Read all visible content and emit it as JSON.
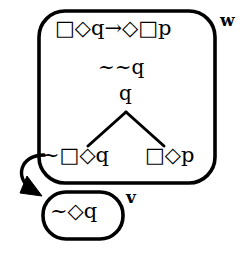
{
  "diagram": {
    "type": "modal-logic-tableau",
    "stroke_color": "#000000",
    "background_color": "#ffffff",
    "worlds": [
      {
        "id": "w",
        "label": "w",
        "shape": "rounded-rectangle",
        "formulas": [
          {
            "id": "premise",
            "text": "□◇q→◇□p",
            "role": "root-implication"
          },
          {
            "id": "double-negation",
            "text": "~~q",
            "role": "assumption"
          },
          {
            "id": "q",
            "text": "q",
            "role": "branch-node"
          },
          {
            "id": "branch-left",
            "text": "~□◇q",
            "role": "left-branch-leaf"
          },
          {
            "id": "branch-right",
            "text": "□◇p",
            "role": "right-branch-leaf"
          }
        ]
      },
      {
        "id": "v",
        "label": "v",
        "shape": "stadium",
        "formulas": [
          {
            "id": "accessible-formula",
            "text": "~◇q",
            "role": "leaf"
          }
        ]
      }
    ],
    "edges": [
      {
        "id": "tree-branch-left",
        "from": "q",
        "to": "branch-left",
        "style": "line"
      },
      {
        "id": "tree-branch-right",
        "from": "q",
        "to": "branch-right",
        "style": "line"
      },
      {
        "id": "accessibility-arrow",
        "from": "w",
        "to": "v",
        "style": "curved-arrow"
      }
    ]
  }
}
